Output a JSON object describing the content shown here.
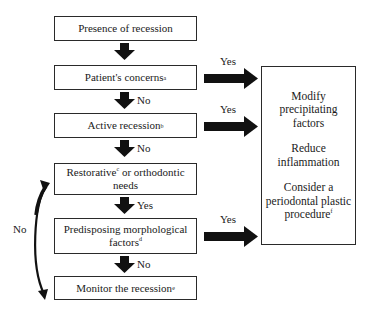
{
  "flowchart": {
    "steps": [
      {
        "text": "Presence of recession",
        "sup": ""
      },
      {
        "text": "Patient's concerns",
        "sup": "a"
      },
      {
        "text": "Active recession",
        "sup": "b"
      },
      {
        "text_pre": "Restorative",
        "sup": "c",
        "text_post": " or orthodontic needs"
      },
      {
        "text": "Predisposing morphological factors",
        "sup": "d"
      },
      {
        "text": "Monitor the recession",
        "sup": "e"
      }
    ],
    "down_labels": [
      "",
      "No",
      "No",
      "Yes",
      "No"
    ],
    "side_labels": [
      "Yes",
      "Yes",
      "Yes"
    ],
    "bypass_label": "No",
    "action_box": {
      "items": [
        {
          "text": "Modify precipitating factors",
          "sup": ""
        },
        {
          "text": "Reduce inflammation",
          "sup": ""
        },
        {
          "text": "Consider a periodontal plastic procedure",
          "sup": "f"
        }
      ]
    }
  }
}
